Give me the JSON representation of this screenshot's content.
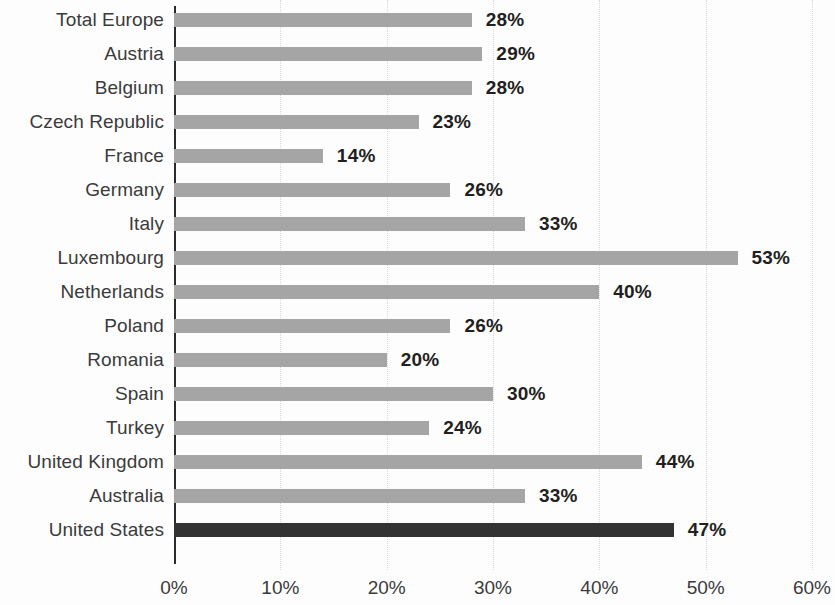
{
  "chart_data": {
    "type": "bar",
    "orientation": "horizontal",
    "title": "",
    "subtitle": "",
    "xlabel": "",
    "ylabel": "",
    "xlim": [
      0,
      60
    ],
    "grid": true,
    "legend": null,
    "categories": [
      "Total Europe",
      "Austria",
      "Belgium",
      "Czech Republic",
      "France",
      "Germany",
      "Italy",
      "Luxembourg",
      "Netherlands",
      "Poland",
      "Romania",
      "Spain",
      "Turkey",
      "United Kingdom",
      "Australia",
      "United States"
    ],
    "values": [
      28,
      29,
      28,
      23,
      14,
      26,
      33,
      53,
      40,
      26,
      20,
      30,
      24,
      44,
      33,
      47
    ],
    "value_labels": [
      "28%",
      "29%",
      "28%",
      "23%",
      "14%",
      "26%",
      "33%",
      "53%",
      "40%",
      "26%",
      "20%",
      "30%",
      "24%",
      "44%",
      "33%",
      "47%"
    ],
    "highlight_indices": [
      15
    ],
    "xticks": [
      0,
      10,
      20,
      30,
      40,
      50,
      60
    ],
    "xtick_labels": [
      "0%",
      "10%",
      "20%",
      "30%",
      "40%",
      "50%",
      "60%"
    ],
    "colors": {
      "bar": "#a5a5a5",
      "bar_highlight": "#333333",
      "axis": "#2b2b2b",
      "gridline": "#d8d8d8",
      "text": "#231f20",
      "category_text": "#3b3b3b",
      "background": "#fdfdfd"
    }
  }
}
